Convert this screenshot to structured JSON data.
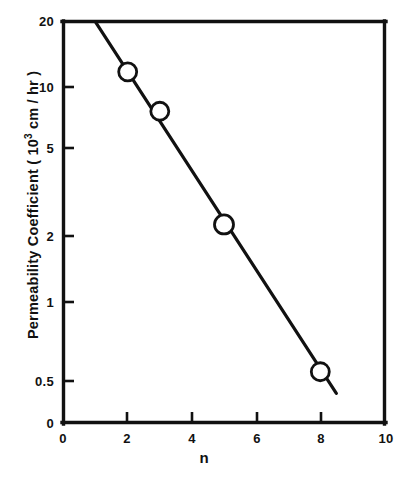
{
  "chart_data": {
    "type": "line",
    "title": "",
    "xlabel": "n",
    "ylabel_parts": {
      "prefix": "Permeability  Coefficient  ( 10",
      "sup": "3",
      "suffix": " cm / hr )"
    },
    "ylabel": "Permeability  Coefficient  ( 10^3 cm / hr )",
    "yscale": "log",
    "xscale": "linear",
    "xlim": [
      0,
      10
    ],
    "ylim": [
      0.5,
      20
    ],
    "grid": false,
    "legend": null,
    "xticks": [
      "0",
      "2",
      "4",
      "6",
      "8",
      "10"
    ],
    "xtick_values": [
      0,
      2,
      4,
      6,
      8,
      10
    ],
    "yticks": [
      "0",
      "0.5",
      "1",
      "2",
      "5",
      "10",
      "20"
    ],
    "ytick_values": [
      0,
      0.5,
      1,
      2,
      5,
      10,
      20
    ],
    "series": [
      {
        "name": "Permeability Coefficient",
        "marker": "open-circle",
        "x": [
          2,
          3,
          5,
          8
        ],
        "values": [
          12,
          8,
          2.5,
          0.55
        ]
      }
    ],
    "fit_line": {
      "x": [
        1.0,
        8.5
      ],
      "y": [
        20.0,
        0.44
      ]
    },
    "color": "#111111"
  },
  "figure": {
    "axis_line_color": "#111111",
    "background": "#ffffff"
  }
}
